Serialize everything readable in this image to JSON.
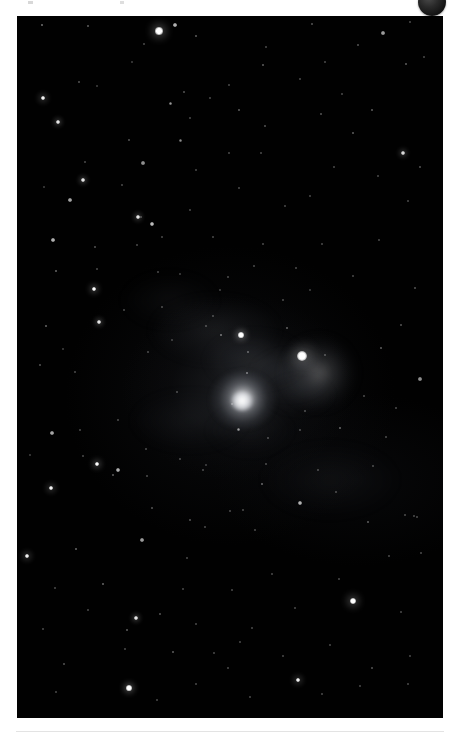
{
  "page": {
    "background_color": "#ffffff"
  },
  "top_chrome": {
    "avatar": {
      "name": "avatar-badge",
      "color": "#1a1a1a",
      "label": ""
    }
  },
  "photo": {
    "name": "astronomy-photograph",
    "alt_text": "Deep sky astrophotograph: dense star field with a diffuse elliptical galaxy left of centre, a bright haloed star to its upper right, and faint nebulosity between them",
    "background_color": "#010101",
    "frame": {
      "x": 17,
      "y": 16,
      "width": 426,
      "height": 702
    },
    "objects": [
      {
        "name": "galaxy",
        "type": "diffuse-galaxy",
        "x": 226,
        "y": 384,
        "radius": 33,
        "brightness": "medium"
      },
      {
        "name": "bright-star",
        "type": "haloed-star",
        "x": 302,
        "y": 357,
        "radius": 6,
        "brightness": "high"
      },
      {
        "name": "nebulosity",
        "type": "faint-nebula",
        "x": 275,
        "y": 385,
        "brightness": "low"
      }
    ],
    "nebulosity_patches": [
      {
        "x": 215,
        "y": 330,
        "w": 120,
        "h": 60,
        "opacity": 0.1
      },
      {
        "x": 255,
        "y": 360,
        "w": 90,
        "h": 48,
        "opacity": 0.13
      },
      {
        "x": 290,
        "y": 375,
        "w": 70,
        "h": 40,
        "opacity": 0.11
      },
      {
        "x": 300,
        "y": 395,
        "w": 60,
        "h": 30,
        "opacity": 0.08
      },
      {
        "x": 190,
        "y": 420,
        "w": 110,
        "h": 55,
        "opacity": 0.06
      },
      {
        "x": 330,
        "y": 480,
        "w": 130,
        "h": 70,
        "opacity": 0.05
      },
      {
        "x": 170,
        "y": 300,
        "w": 90,
        "h": 50,
        "opacity": 0.05
      },
      {
        "x": 250,
        "y": 430,
        "w": 80,
        "h": 45,
        "opacity": 0.05
      }
    ],
    "stars": [
      {
        "x": 159,
        "y": 31,
        "r": 3.6,
        "b": 1.0
      },
      {
        "x": 42,
        "y": 25,
        "r": 1.4,
        "b": 0.6
      },
      {
        "x": 88,
        "y": 26,
        "r": 1.1,
        "b": 0.5
      },
      {
        "x": 175,
        "y": 25,
        "r": 1.8,
        "b": 0.8
      },
      {
        "x": 196,
        "y": 36,
        "r": 1.2,
        "b": 0.5
      },
      {
        "x": 312,
        "y": 24,
        "r": 1.1,
        "b": 0.45
      },
      {
        "x": 383,
        "y": 33,
        "r": 1.6,
        "b": 0.7
      },
      {
        "x": 410,
        "y": 22,
        "r": 1.0,
        "b": 0.4
      },
      {
        "x": 358,
        "y": 45,
        "r": 1.1,
        "b": 0.45
      },
      {
        "x": 266,
        "y": 47,
        "r": 1.0,
        "b": 0.4
      },
      {
        "x": 144,
        "y": 44,
        "r": 1.0,
        "b": 0.4
      },
      {
        "x": 43,
        "y": 98,
        "r": 2.3,
        "b": 0.95
      },
      {
        "x": 132,
        "y": 62,
        "r": 1.0,
        "b": 0.35
      },
      {
        "x": 184,
        "y": 92,
        "r": 1.1,
        "b": 0.45
      },
      {
        "x": 229,
        "y": 85,
        "r": 1.0,
        "b": 0.4
      },
      {
        "x": 263,
        "y": 65,
        "r": 1.2,
        "b": 0.5
      },
      {
        "x": 300,
        "y": 79,
        "r": 1.0,
        "b": 0.4
      },
      {
        "x": 325,
        "y": 62,
        "r": 1.0,
        "b": 0.4
      },
      {
        "x": 406,
        "y": 64,
        "r": 1.3,
        "b": 0.5
      },
      {
        "x": 424,
        "y": 57,
        "r": 1.0,
        "b": 0.4
      },
      {
        "x": 79,
        "y": 82,
        "r": 1.1,
        "b": 0.45
      },
      {
        "x": 58,
        "y": 122,
        "r": 2.0,
        "b": 0.9
      },
      {
        "x": 97,
        "y": 86,
        "r": 1.0,
        "b": 0.35
      },
      {
        "x": 170,
        "y": 103,
        "r": 1.5,
        "b": 0.6
      },
      {
        "x": 180,
        "y": 140,
        "r": 1.5,
        "b": 0.55
      },
      {
        "x": 190,
        "y": 118,
        "r": 1.0,
        "b": 0.4
      },
      {
        "x": 210,
        "y": 98,
        "r": 1.0,
        "b": 0.4
      },
      {
        "x": 239,
        "y": 110,
        "r": 1.2,
        "b": 0.5
      },
      {
        "x": 265,
        "y": 126,
        "r": 1.1,
        "b": 0.45
      },
      {
        "x": 321,
        "y": 114,
        "r": 1.1,
        "b": 0.45
      },
      {
        "x": 342,
        "y": 94,
        "r": 1.0,
        "b": 0.4
      },
      {
        "x": 372,
        "y": 110,
        "r": 1.2,
        "b": 0.5
      },
      {
        "x": 403,
        "y": 153,
        "r": 2.0,
        "b": 0.85
      },
      {
        "x": 353,
        "y": 133,
        "r": 1.2,
        "b": 0.5
      },
      {
        "x": 229,
        "y": 153,
        "r": 1.0,
        "b": 0.4
      },
      {
        "x": 261,
        "y": 153,
        "r": 1.0,
        "b": 0.4
      },
      {
        "x": 129,
        "y": 140,
        "r": 1.1,
        "b": 0.45
      },
      {
        "x": 143,
        "y": 163,
        "r": 1.6,
        "b": 0.65
      },
      {
        "x": 85,
        "y": 162,
        "r": 1.0,
        "b": 0.4
      },
      {
        "x": 196,
        "y": 170,
        "r": 1.0,
        "b": 0.4
      },
      {
        "x": 334,
        "y": 167,
        "r": 1.0,
        "b": 0.4
      },
      {
        "x": 378,
        "y": 176,
        "r": 1.0,
        "b": 0.4
      },
      {
        "x": 420,
        "y": 167,
        "r": 1.1,
        "b": 0.45
      },
      {
        "x": 83,
        "y": 180,
        "r": 2.2,
        "b": 0.9
      },
      {
        "x": 70,
        "y": 200,
        "r": 1.8,
        "b": 0.75
      },
      {
        "x": 44,
        "y": 187,
        "r": 1.0,
        "b": 0.35
      },
      {
        "x": 122,
        "y": 185,
        "r": 1.0,
        "b": 0.4
      },
      {
        "x": 239,
        "y": 188,
        "r": 1.0,
        "b": 0.4
      },
      {
        "x": 285,
        "y": 206,
        "r": 1.0,
        "b": 0.4
      },
      {
        "x": 310,
        "y": 196,
        "r": 1.0,
        "b": 0.4
      },
      {
        "x": 408,
        "y": 201,
        "r": 1.0,
        "b": 0.4
      },
      {
        "x": 138,
        "y": 217,
        "r": 2.0,
        "b": 0.9
      },
      {
        "x": 152,
        "y": 224,
        "r": 1.9,
        "b": 0.85
      },
      {
        "x": 190,
        "y": 210,
        "r": 1.0,
        "b": 0.4
      },
      {
        "x": 53,
        "y": 240,
        "r": 1.8,
        "b": 0.8
      },
      {
        "x": 95,
        "y": 247,
        "r": 1.1,
        "b": 0.45
      },
      {
        "x": 162,
        "y": 237,
        "r": 1.0,
        "b": 0.4
      },
      {
        "x": 137,
        "y": 245,
        "r": 1.0,
        "b": 0.4
      },
      {
        "x": 213,
        "y": 237,
        "r": 1.0,
        "b": 0.4
      },
      {
        "x": 263,
        "y": 244,
        "r": 1.0,
        "b": 0.4
      },
      {
        "x": 322,
        "y": 244,
        "r": 1.0,
        "b": 0.4
      },
      {
        "x": 379,
        "y": 240,
        "r": 1.0,
        "b": 0.4
      },
      {
        "x": 141,
        "y": 217,
        "r": 1.0,
        "b": 0.4
      },
      {
        "x": 56,
        "y": 271,
        "r": 1.4,
        "b": 0.55
      },
      {
        "x": 94,
        "y": 289,
        "r": 2.4,
        "b": 1.0
      },
      {
        "x": 158,
        "y": 272,
        "r": 1.0,
        "b": 0.4
      },
      {
        "x": 180,
        "y": 274,
        "r": 1.0,
        "b": 0.35
      },
      {
        "x": 228,
        "y": 277,
        "r": 1.0,
        "b": 0.4
      },
      {
        "x": 254,
        "y": 266,
        "r": 1.0,
        "b": 0.4
      },
      {
        "x": 296,
        "y": 268,
        "r": 1.0,
        "b": 0.4
      },
      {
        "x": 353,
        "y": 276,
        "r": 1.0,
        "b": 0.4
      },
      {
        "x": 415,
        "y": 288,
        "r": 1.1,
        "b": 0.45
      },
      {
        "x": 97,
        "y": 269,
        "r": 1.0,
        "b": 0.4
      },
      {
        "x": 124,
        "y": 310,
        "r": 1.0,
        "b": 0.4
      },
      {
        "x": 99,
        "y": 322,
        "r": 2.2,
        "b": 0.9
      },
      {
        "x": 46,
        "y": 326,
        "r": 1.4,
        "b": 0.55
      },
      {
        "x": 162,
        "y": 307,
        "r": 1.0,
        "b": 0.4
      },
      {
        "x": 213,
        "y": 316,
        "r": 1.0,
        "b": 0.4
      },
      {
        "x": 241,
        "y": 335,
        "r": 2.6,
        "b": 1.0
      },
      {
        "x": 221,
        "y": 335,
        "r": 1.4,
        "b": 0.6
      },
      {
        "x": 206,
        "y": 326,
        "r": 1.0,
        "b": 0.4
      },
      {
        "x": 287,
        "y": 328,
        "r": 1.2,
        "b": 0.5
      },
      {
        "x": 302,
        "y": 356,
        "r": 5.4,
        "b": 1.0
      },
      {
        "x": 325,
        "y": 355,
        "r": 1.0,
        "b": 0.4
      },
      {
        "x": 247,
        "y": 373,
        "r": 1.4,
        "b": 0.6
      },
      {
        "x": 248,
        "y": 352,
        "r": 1.2,
        "b": 0.5
      },
      {
        "x": 381,
        "y": 348,
        "r": 1.2,
        "b": 0.5
      },
      {
        "x": 420,
        "y": 379,
        "r": 1.6,
        "b": 0.65
      },
      {
        "x": 401,
        "y": 325,
        "r": 1.1,
        "b": 0.45
      },
      {
        "x": 40,
        "y": 365,
        "r": 1.1,
        "b": 0.45
      },
      {
        "x": 75,
        "y": 372,
        "r": 1.0,
        "b": 0.4
      },
      {
        "x": 148,
        "y": 352,
        "r": 1.0,
        "b": 0.4
      },
      {
        "x": 177,
        "y": 392,
        "r": 1.0,
        "b": 0.4
      },
      {
        "x": 232,
        "y": 404,
        "r": 1.0,
        "b": 0.4
      },
      {
        "x": 305,
        "y": 411,
        "r": 1.0,
        "b": 0.4
      },
      {
        "x": 238,
        "y": 429,
        "r": 1.5,
        "b": 0.6
      },
      {
        "x": 268,
        "y": 438,
        "r": 1.0,
        "b": 0.4
      },
      {
        "x": 300,
        "y": 430,
        "r": 1.0,
        "b": 0.4
      },
      {
        "x": 340,
        "y": 428,
        "r": 1.4,
        "b": 0.55
      },
      {
        "x": 386,
        "y": 437,
        "r": 1.0,
        "b": 0.4
      },
      {
        "x": 118,
        "y": 420,
        "r": 1.0,
        "b": 0.4
      },
      {
        "x": 52,
        "y": 433,
        "r": 1.8,
        "b": 0.75
      },
      {
        "x": 83,
        "y": 456,
        "r": 1.0,
        "b": 0.4
      },
      {
        "x": 146,
        "y": 449,
        "r": 1.0,
        "b": 0.4
      },
      {
        "x": 180,
        "y": 459,
        "r": 1.0,
        "b": 0.4
      },
      {
        "x": 97,
        "y": 464,
        "r": 2.4,
        "b": 1.0
      },
      {
        "x": 118,
        "y": 470,
        "r": 1.9,
        "b": 0.8
      },
      {
        "x": 203,
        "y": 470,
        "r": 1.0,
        "b": 0.4
      },
      {
        "x": 266,
        "y": 464,
        "r": 1.0,
        "b": 0.4
      },
      {
        "x": 318,
        "y": 470,
        "r": 1.0,
        "b": 0.4
      },
      {
        "x": 373,
        "y": 466,
        "r": 1.0,
        "b": 0.4
      },
      {
        "x": 51,
        "y": 488,
        "r": 2.3,
        "b": 0.95
      },
      {
        "x": 113,
        "y": 475,
        "r": 1.2,
        "b": 0.5
      },
      {
        "x": 147,
        "y": 476,
        "r": 1.0,
        "b": 0.4
      },
      {
        "x": 262,
        "y": 484,
        "r": 1.4,
        "b": 0.55
      },
      {
        "x": 300,
        "y": 503,
        "r": 1.9,
        "b": 0.8
      },
      {
        "x": 336,
        "y": 492,
        "r": 1.0,
        "b": 0.4
      },
      {
        "x": 405,
        "y": 515,
        "r": 1.0,
        "b": 0.4
      },
      {
        "x": 417,
        "y": 517,
        "r": 1.0,
        "b": 0.4
      },
      {
        "x": 230,
        "y": 511,
        "r": 1.0,
        "b": 0.4
      },
      {
        "x": 152,
        "y": 508,
        "r": 1.1,
        "b": 0.45
      },
      {
        "x": 205,
        "y": 527,
        "r": 1.0,
        "b": 0.4
      },
      {
        "x": 243,
        "y": 510,
        "r": 1.0,
        "b": 0.4
      },
      {
        "x": 255,
        "y": 530,
        "r": 1.0,
        "b": 0.4
      },
      {
        "x": 27,
        "y": 556,
        "r": 2.3,
        "b": 0.95
      },
      {
        "x": 76,
        "y": 549,
        "r": 1.4,
        "b": 0.55
      },
      {
        "x": 142,
        "y": 540,
        "r": 1.7,
        "b": 0.7
      },
      {
        "x": 190,
        "y": 520,
        "r": 1.1,
        "b": 0.45
      },
      {
        "x": 368,
        "y": 522,
        "r": 1.3,
        "b": 0.5
      },
      {
        "x": 414,
        "y": 516,
        "r": 1.0,
        "b": 0.4
      },
      {
        "x": 339,
        "y": 579,
        "r": 1.0,
        "b": 0.4
      },
      {
        "x": 272,
        "y": 574,
        "r": 1.0,
        "b": 0.4
      },
      {
        "x": 103,
        "y": 584,
        "r": 1.4,
        "b": 0.55
      },
      {
        "x": 55,
        "y": 588,
        "r": 1.0,
        "b": 0.4
      },
      {
        "x": 183,
        "y": 589,
        "r": 1.0,
        "b": 0.4
      },
      {
        "x": 232,
        "y": 590,
        "r": 1.0,
        "b": 0.4
      },
      {
        "x": 187,
        "y": 558,
        "r": 1.0,
        "b": 0.4
      },
      {
        "x": 353,
        "y": 601,
        "r": 3.4,
        "b": 1.0
      },
      {
        "x": 389,
        "y": 556,
        "r": 1.0,
        "b": 0.4
      },
      {
        "x": 421,
        "y": 553,
        "r": 1.0,
        "b": 0.4
      },
      {
        "x": 295,
        "y": 608,
        "r": 1.0,
        "b": 0.4
      },
      {
        "x": 401,
        "y": 612,
        "r": 1.0,
        "b": 0.4
      },
      {
        "x": 136,
        "y": 618,
        "r": 2.2,
        "b": 0.9
      },
      {
        "x": 160,
        "y": 614,
        "r": 1.1,
        "b": 0.45
      },
      {
        "x": 127,
        "y": 630,
        "r": 1.2,
        "b": 0.5
      },
      {
        "x": 88,
        "y": 610,
        "r": 1.0,
        "b": 0.4
      },
      {
        "x": 43,
        "y": 629,
        "r": 1.0,
        "b": 0.4
      },
      {
        "x": 196,
        "y": 624,
        "r": 1.0,
        "b": 0.4
      },
      {
        "x": 252,
        "y": 628,
        "r": 1.0,
        "b": 0.4
      },
      {
        "x": 173,
        "y": 652,
        "r": 1.3,
        "b": 0.5
      },
      {
        "x": 125,
        "y": 649,
        "r": 1.0,
        "b": 0.4
      },
      {
        "x": 64,
        "y": 664,
        "r": 1.1,
        "b": 0.45
      },
      {
        "x": 214,
        "y": 653,
        "r": 1.0,
        "b": 0.4
      },
      {
        "x": 240,
        "y": 642,
        "r": 1.0,
        "b": 0.4
      },
      {
        "x": 283,
        "y": 656,
        "r": 1.0,
        "b": 0.4
      },
      {
        "x": 330,
        "y": 645,
        "r": 1.0,
        "b": 0.4
      },
      {
        "x": 372,
        "y": 668,
        "r": 1.1,
        "b": 0.45
      },
      {
        "x": 410,
        "y": 656,
        "r": 1.0,
        "b": 0.4
      },
      {
        "x": 129,
        "y": 688,
        "r": 2.6,
        "b": 1.0
      },
      {
        "x": 298,
        "y": 680,
        "r": 2.3,
        "b": 0.95
      },
      {
        "x": 228,
        "y": 668,
        "r": 1.0,
        "b": 0.4
      },
      {
        "x": 196,
        "y": 684,
        "r": 1.0,
        "b": 0.4
      },
      {
        "x": 360,
        "y": 686,
        "r": 1.0,
        "b": 0.4
      },
      {
        "x": 408,
        "y": 684,
        "r": 1.0,
        "b": 0.4
      },
      {
        "x": 56,
        "y": 692,
        "r": 1.0,
        "b": 0.4
      },
      {
        "x": 157,
        "y": 700,
        "r": 1.0,
        "b": 0.4
      },
      {
        "x": 250,
        "y": 697,
        "r": 1.0,
        "b": 0.4
      },
      {
        "x": 322,
        "y": 694,
        "r": 1.0,
        "b": 0.4
      },
      {
        "x": 80,
        "y": 430,
        "r": 1.0,
        "b": 0.4
      },
      {
        "x": 30,
        "y": 455,
        "r": 1.0,
        "b": 0.35
      },
      {
        "x": 364,
        "y": 396,
        "r": 1.0,
        "b": 0.4
      },
      {
        "x": 396,
        "y": 408,
        "r": 1.0,
        "b": 0.4
      },
      {
        "x": 206,
        "y": 465,
        "r": 1.0,
        "b": 0.35
      },
      {
        "x": 283,
        "y": 300,
        "r": 1.0,
        "b": 0.4
      },
      {
        "x": 310,
        "y": 290,
        "r": 1.0,
        "b": 0.35
      },
      {
        "x": 220,
        "y": 290,
        "r": 1.0,
        "b": 0.35
      },
      {
        "x": 63,
        "y": 349,
        "r": 1.0,
        "b": 0.35
      },
      {
        "x": 172,
        "y": 340,
        "r": 1.0,
        "b": 0.35
      }
    ]
  },
  "bottom_chrome": {
    "divider_color": "#e3e3e3"
  }
}
